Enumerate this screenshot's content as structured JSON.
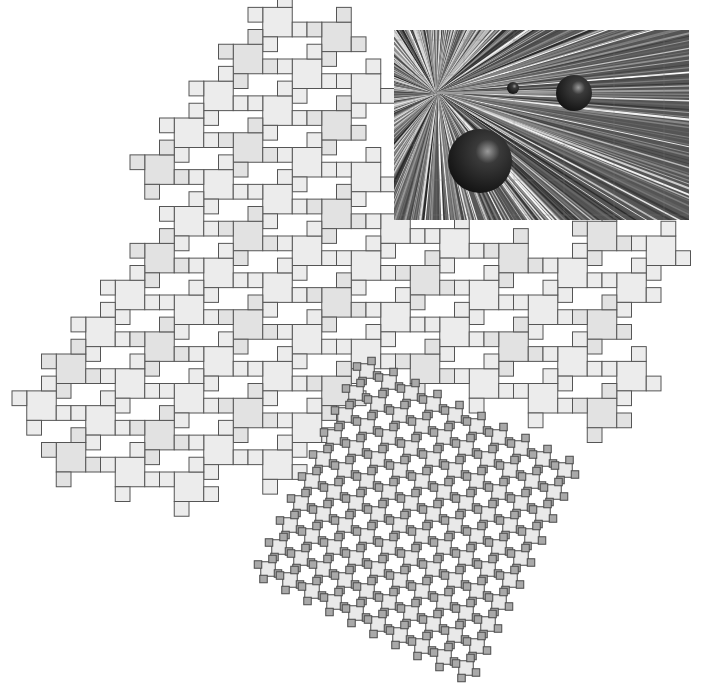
{
  "figure": {
    "title": "Fractal tiling of cross-shaped tiles with ray-traced render inset",
    "background": "#ffffff",
    "tile_colors": {
      "large_fill": "#ececec",
      "large_fill_alt": "#e2e2e2",
      "large_stroke": "#555555",
      "small_fill": "#e9e9e9",
      "small_arm_fill": "#a9a9a9",
      "small_stroke": "#4a4a4a"
    },
    "large_tiling": {
      "cell": 29.5,
      "arm": 14.75,
      "lattice_a": [
        2,
        1
      ],
      "lattice_b": [
        -1,
        2
      ],
      "origin": [
        248,
        236
      ],
      "label": "large-scale cross tiling"
    },
    "small_tiling": {
      "cell": 10.5,
      "arm": 7.5,
      "origin": [
        400,
        470
      ],
      "label": "small-scale cross tiling (iterated)"
    },
    "render_inset": {
      "label": "ray-traced scene with reflective spheres",
      "rays_center": [
        437,
        93
      ],
      "spheres": [
        {
          "cx": 86,
          "cy": 131,
          "r": 32
        },
        {
          "cx": 180,
          "cy": 63,
          "r": 18
        },
        {
          "cx": 119,
          "cy": 58,
          "r": 6
        }
      ]
    }
  }
}
